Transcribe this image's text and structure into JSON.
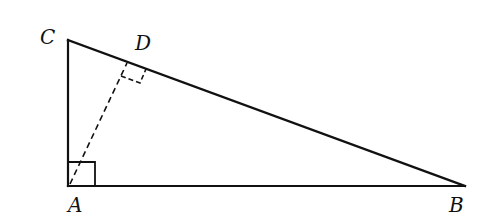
{
  "diagram": {
    "type": "right-triangle-with-altitude",
    "points": {
      "A": {
        "label": "A",
        "x": 68,
        "y": 186
      },
      "B": {
        "label": "B",
        "x": 465,
        "y": 186
      },
      "C": {
        "label": "C",
        "x": 68,
        "y": 40
      },
      "D": {
        "label": "D",
        "x": 127,
        "y": 62
      }
    },
    "segments": [
      {
        "from": "C",
        "to": "A",
        "style": "solid"
      },
      {
        "from": "A",
        "to": "B",
        "style": "solid"
      },
      {
        "from": "C",
        "to": "B",
        "style": "solid"
      },
      {
        "from": "A",
        "to": "D",
        "style": "dashed"
      }
    ],
    "right_angles": [
      "A",
      "D"
    ],
    "labels": {
      "A": "A",
      "B": "B",
      "C": "C",
      "D": "D"
    }
  }
}
